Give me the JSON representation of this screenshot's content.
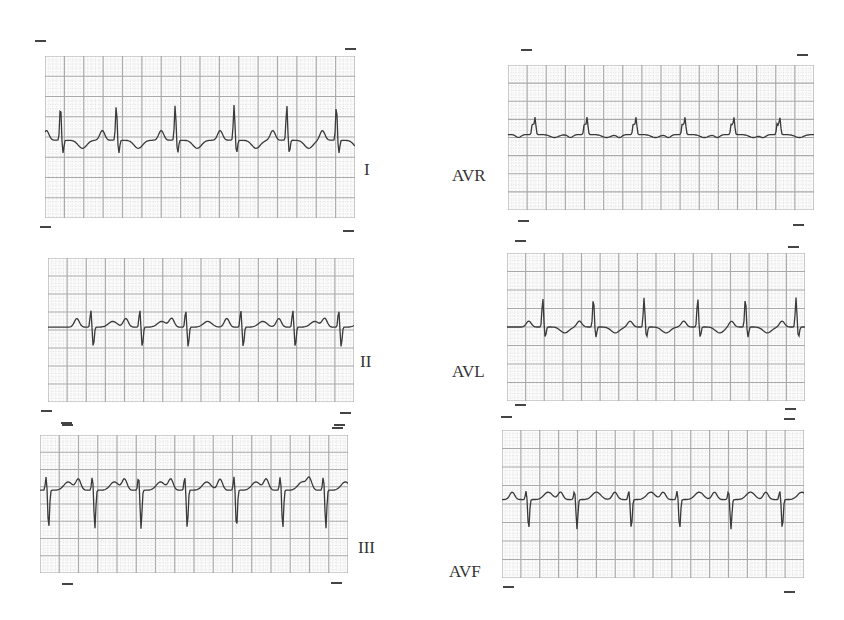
{
  "figure": {
    "title": "",
    "colors": {
      "grid_major": "#a9a9a9",
      "grid_minor": "#cfcfcf",
      "trace": "#3a3a3a",
      "paper": "#fbfbfb"
    },
    "leads": [
      {
        "id": "I",
        "label": "I",
        "x": 45,
        "y": 56,
        "w": 310,
        "h": 162,
        "label_x": 364,
        "label_y": 170,
        "baseline": 0.52,
        "beats": [
          0.05,
          0.23,
          0.42,
          0.61,
          0.78,
          0.94
        ],
        "r": 0.22,
        "s": 0.08,
        "p": 0.06,
        "t": -0.05
      },
      {
        "id": "AVR",
        "label": "AVR",
        "x": 508,
        "y": 65,
        "w": 306,
        "h": 145,
        "label_x": 452,
        "label_y": 176,
        "baseline": 0.48,
        "beats": [
          0.08,
          0.25,
          0.41,
          0.57,
          0.73,
          0.88
        ],
        "r": 0.08,
        "s": -0.12,
        "p": -0.02,
        "t": -0.02
      },
      {
        "id": "II",
        "label": "II",
        "x": 48,
        "y": 258,
        "w": 306,
        "h": 144,
        "label_x": 360,
        "label_y": 362,
        "baseline": 0.48,
        "beats": [
          0.14,
          0.3,
          0.45,
          0.63,
          0.8,
          0.95
        ],
        "r": 0.12,
        "s": 0.14,
        "p": 0.06,
        "t": 0.04
      },
      {
        "id": "AVL",
        "label": "AVL",
        "x": 507,
        "y": 253,
        "w": 298,
        "h": 148,
        "label_x": 452,
        "label_y": 372,
        "baseline": 0.5,
        "beats": [
          0.12,
          0.29,
          0.46,
          0.64,
          0.8,
          0.97
        ],
        "r": 0.2,
        "s": 0.07,
        "p": 0.04,
        "t": -0.04
      },
      {
        "id": "III",
        "label": "III",
        "x": 40,
        "y": 435,
        "w": 308,
        "h": 138,
        "label_x": 358,
        "label_y": 548,
        "baseline": 0.4,
        "beats": [
          0.02,
          0.17,
          0.32,
          0.47,
          0.63,
          0.78,
          0.92
        ],
        "r": 0.1,
        "s": 0.28,
        "p": 0.08,
        "t": 0.06
      },
      {
        "id": "AVF",
        "label": "AVF",
        "x": 502,
        "y": 430,
        "w": 302,
        "h": 148,
        "label_x": 449,
        "label_y": 572,
        "baseline": 0.47,
        "beats": [
          0.08,
          0.24,
          0.42,
          0.58,
          0.75,
          0.92
        ],
        "r": 0.06,
        "s": 0.2,
        "p": 0.05,
        "t": 0.05
      }
    ],
    "ticks": [
      [
        35,
        40
      ],
      [
        345,
        48
      ],
      [
        40,
        226
      ],
      [
        343,
        230
      ],
      [
        521,
        49
      ],
      [
        797,
        54
      ],
      [
        518,
        220
      ],
      [
        793,
        224
      ],
      [
        515,
        240
      ],
      [
        788,
        246
      ],
      [
        41,
        410
      ],
      [
        61,
        422
      ],
      [
        340,
        412
      ],
      [
        334,
        424
      ],
      [
        515,
        404
      ],
      [
        501,
        416
      ],
      [
        785,
        408
      ],
      [
        784,
        418
      ],
      [
        62,
        424
      ],
      [
        332,
        427
      ],
      [
        62,
        583
      ],
      [
        331,
        582
      ],
      [
        503,
        586
      ],
      [
        784,
        591
      ]
    ]
  }
}
